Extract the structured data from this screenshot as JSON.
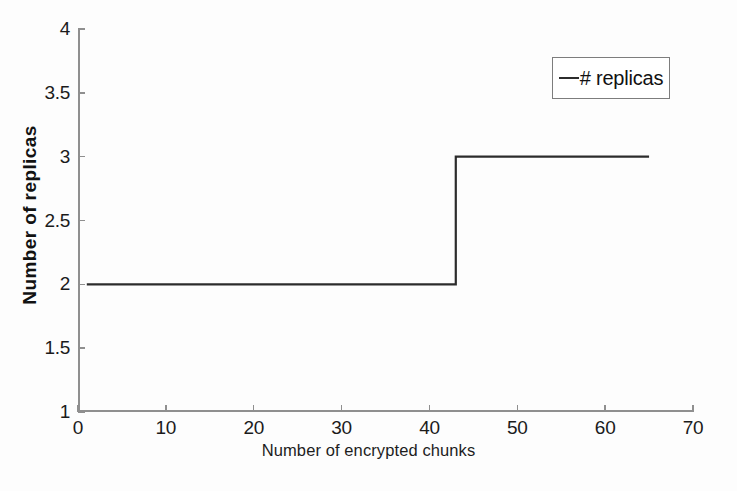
{
  "chart_data": {
    "type": "line",
    "title": "",
    "subtitle": "",
    "xlabel": "Number of encrypted chunks",
    "ylabel": "Number of replicas",
    "xlim": [
      0,
      70
    ],
    "ylim": [
      1,
      4
    ],
    "xticks": [
      0,
      10,
      20,
      30,
      40,
      50,
      60,
      70
    ],
    "xticklabels": [
      "0",
      "10",
      "20",
      "30",
      "40",
      "50",
      "60",
      "70"
    ],
    "yticks": [
      1,
      1.5,
      2,
      2.5,
      3,
      3.5,
      4
    ],
    "yticklabels": [
      "1",
      "1.5",
      "2",
      "2.5",
      "3",
      "3.5",
      "4"
    ],
    "grid": false,
    "legend_position": "top-right",
    "line_color": "#2c2c2c",
    "axis_color": "#8f8f8f",
    "background_color": "#fdfdfd",
    "series": [
      {
        "name": "# replicas",
        "style": "step",
        "x": [
          1,
          43,
          43,
          65
        ],
        "values": [
          2,
          2,
          3,
          3
        ],
        "step_at_x": 43,
        "levels": [
          {
            "from_x": 1,
            "to_x": 43,
            "y": 2
          },
          {
            "from_x": 43,
            "to_x": 65,
            "y": 3
          }
        ]
      }
    ],
    "annotations": []
  },
  "legend": {
    "entries": [
      {
        "label": "# replicas",
        "swatch": "line-dash-icon",
        "color": "#2c2c2c"
      }
    ]
  },
  "axes": {
    "x_title": "Number of encrypted chunks",
    "y_title": "Number of replicas"
  }
}
